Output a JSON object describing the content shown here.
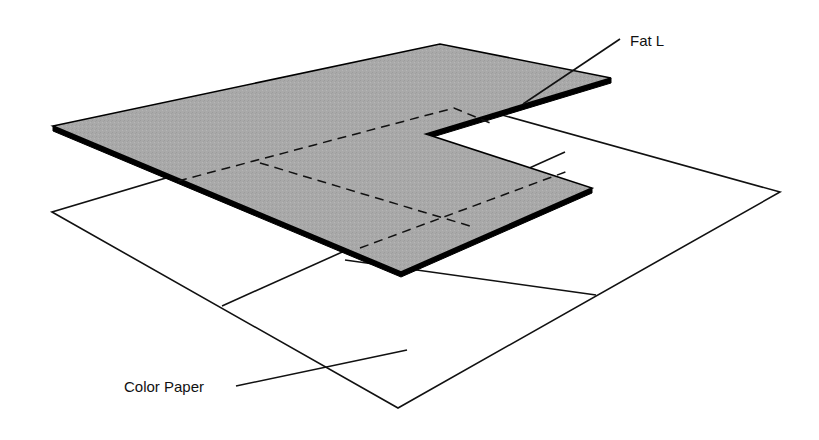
{
  "diagram": {
    "labels": {
      "fat_l": "Fat L",
      "color_paper": "Color Paper"
    },
    "colors": {
      "background": "#ffffff",
      "line": "#111111",
      "fat_l_fill": "#a9a9a9",
      "fat_l_edge": "#000000"
    },
    "color_paper": {
      "outline": [
        [
          52,
          212
        ],
        [
          398,
          408
        ],
        [
          780,
          192
        ],
        [
          437,
          97
        ]
      ],
      "grid_lines": [
        [
          [
            222,
            306
          ],
          [
            565,
            152
          ]
        ],
        [
          [
            345,
            260
          ],
          [
            596,
            295
          ]
        ]
      ]
    },
    "fat_l": {
      "outline": [
        [
          53,
          126
        ],
        [
          440,
          44
        ],
        [
          611,
          78
        ],
        [
          426,
          134
        ],
        [
          592,
          188
        ],
        [
          401,
          272
        ]
      ],
      "hidden_lines": [
        [
          [
            178,
            181
          ],
          [
            454,
            108
          ],
          [
            490,
            123
          ]
        ],
        [
          [
            260,
            163
          ],
          [
            470,
            226
          ]
        ],
        [
          [
            360,
            248
          ],
          [
            568,
            171
          ]
        ]
      ]
    },
    "leaders": {
      "fat_l": {
        "from": [
          523,
          104
        ],
        "to": [
          620,
          39
        ],
        "text_at": [
          630,
          46
        ]
      },
      "color_paper": {
        "from": [
          236,
          386
        ],
        "to": [
          407,
          350
        ],
        "text_at": [
          124,
          392
        ]
      }
    }
  }
}
